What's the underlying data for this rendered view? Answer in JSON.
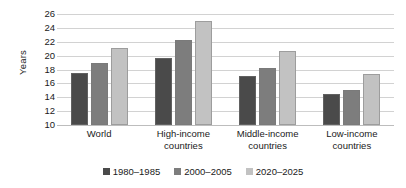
{
  "chart_data": {
    "type": "bar",
    "title": "",
    "subtitle": "",
    "xlabel": "",
    "ylabel": "Years",
    "ylim": [
      10,
      26
    ],
    "ytick_step": 2,
    "yticks": [
      26,
      24,
      22,
      20,
      18,
      16,
      14,
      12,
      10
    ],
    "grid": true,
    "legend_position": "bottom",
    "categories": [
      "World",
      "High-income countries",
      "Middle-income countries",
      "Low-income countries"
    ],
    "category_lines": [
      [
        "World",
        ""
      ],
      [
        "High-income",
        "countries"
      ],
      [
        "Middle-income",
        "countries"
      ],
      [
        "Low-income",
        "countries"
      ]
    ],
    "series": [
      {
        "name": "1980–1985",
        "color": "#4a4a4a",
        "values": [
          17.5,
          19.7,
          17.0,
          14.5
        ]
      },
      {
        "name": "2000–2005",
        "color": "#7d7d7d",
        "values": [
          19.0,
          22.3,
          18.2,
          15.0
        ]
      },
      {
        "name": "2020–2025",
        "color": "#c2c2c2",
        "values": [
          21.1,
          25.0,
          20.7,
          17.3
        ]
      }
    ]
  },
  "colors": {
    "gridline": "#d2d2d2",
    "text": "#1a1a1a",
    "background": "#ffffff"
  }
}
